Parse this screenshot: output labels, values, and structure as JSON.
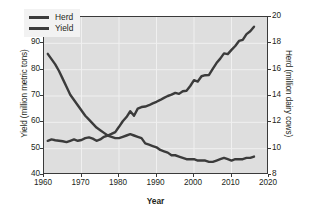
{
  "chart_data": {
    "type": "line",
    "title": "",
    "xlabel": "Year",
    "ylabel": "Yield (million metric tons)",
    "y2label": "Herd (million dairy cows)",
    "xlim": [
      1960,
      2020
    ],
    "ylim": [
      40,
      100
    ],
    "y2lim": [
      8,
      20
    ],
    "grid": true,
    "legend_position": "top-left",
    "x_ticks": [
      "1960",
      "1970",
      "1980",
      "1990",
      "2000",
      "2010",
      "2020"
    ],
    "y_ticks": [
      "40",
      "50",
      "60",
      "70",
      "80",
      "90",
      "100"
    ],
    "y2_ticks": [
      "8",
      "10",
      "12",
      "14",
      "16",
      "18",
      "20"
    ],
    "series": [
      {
        "name": "Herd",
        "axis": "right",
        "units": "million dairy cows",
        "color": "#3b3b3b",
        "x": [
          1961,
          1962,
          1963,
          1964,
          1965,
          1966,
          1967,
          1968,
          1969,
          1970,
          1971,
          1972,
          1973,
          1974,
          1975,
          1976,
          1977,
          1978,
          1979,
          1980,
          1981,
          1982,
          1983,
          1984,
          1985,
          1986,
          1987,
          1988,
          1989,
          1990,
          1991,
          1992,
          1993,
          1994,
          1995,
          1996,
          1997,
          1998,
          1999,
          2000,
          2001,
          2002,
          2003,
          2004,
          2005,
          2006,
          2007,
          2008,
          2009,
          2010,
          2011,
          2012,
          2013,
          2014,
          2015,
          2016
        ],
        "values": [
          17.2,
          16.8,
          16.4,
          15.9,
          15.3,
          14.7,
          14.1,
          13.7,
          13.3,
          12.9,
          12.5,
          12.2,
          11.9,
          11.6,
          11.4,
          11.2,
          11.0,
          10.9,
          10.8,
          10.8,
          10.9,
          11.0,
          11.1,
          11.0,
          10.9,
          10.8,
          10.4,
          10.3,
          10.2,
          10.1,
          9.9,
          9.8,
          9.7,
          9.5,
          9.5,
          9.4,
          9.3,
          9.2,
          9.2,
          9.2,
          9.1,
          9.1,
          9.1,
          9.0,
          9.0,
          9.1,
          9.2,
          9.3,
          9.2,
          9.1,
          9.2,
          9.2,
          9.2,
          9.3,
          9.3,
          9.4
        ]
      },
      {
        "name": "Yield",
        "axis": "left",
        "units": "million metric tons",
        "color": "#3b3b3b",
        "x": [
          1961,
          1962,
          1963,
          1964,
          1965,
          1966,
          1967,
          1968,
          1969,
          1970,
          1971,
          1972,
          1973,
          1974,
          1975,
          1976,
          1977,
          1978,
          1979,
          1980,
          1981,
          1982,
          1983,
          1984,
          1985,
          1986,
          1987,
          1988,
          1989,
          1990,
          1991,
          1992,
          1993,
          1994,
          1995,
          1996,
          1997,
          1998,
          1999,
          2000,
          2001,
          2002,
          2003,
          2004,
          2005,
          2006,
          2007,
          2008,
          2009,
          2010,
          2011,
          2012,
          2013,
          2014,
          2015,
          2016
        ],
        "values": [
          53.0,
          53.5,
          53.2,
          53.0,
          52.8,
          52.5,
          53.0,
          53.5,
          53.0,
          53.3,
          54.0,
          54.3,
          53.8,
          53.0,
          53.5,
          54.5,
          55.0,
          55.6,
          56.3,
          58.3,
          60.4,
          62.0,
          64.2,
          62.5,
          65.2,
          65.8,
          66.0,
          66.5,
          67.2,
          67.8,
          68.5,
          69.3,
          70.0,
          70.5,
          71.2,
          70.8,
          71.8,
          72.0,
          73.8,
          76.0,
          75.5,
          77.5,
          77.9,
          78.0,
          80.3,
          82.5,
          84.2,
          86.2,
          85.9,
          87.5,
          89.0,
          90.9,
          91.3,
          93.5,
          94.6,
          96.3
        ]
      }
    ]
  },
  "legend": {
    "items": [
      {
        "label": "Herd"
      },
      {
        "label": "Yield"
      }
    ]
  }
}
